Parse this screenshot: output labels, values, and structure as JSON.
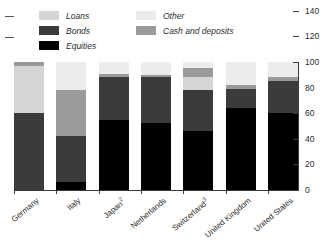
{
  "legend": {
    "columns": [
      {
        "items": [
          {
            "label": "Loans",
            "color": "#d5d5d5",
            "name": "legend-loans"
          },
          {
            "label": "Bonds",
            "color": "#3b3b3b",
            "name": "legend-bonds"
          },
          {
            "label": "Equities",
            "color": "#000000",
            "name": "legend-equities"
          }
        ]
      },
      {
        "items": [
          {
            "label": "Other",
            "color": "#ececec",
            "name": "legend-other"
          },
          {
            "label": "Cash and deposits",
            "color": "#9a9a9a",
            "name": "legend-cash-and-deposits"
          }
        ]
      }
    ]
  },
  "axis": {
    "ticks": [
      {
        "value": 0,
        "label": "0"
      },
      {
        "value": 20,
        "label": "20"
      },
      {
        "value": 40,
        "label": "40"
      },
      {
        "value": 60,
        "label": "60"
      },
      {
        "value": 80,
        "label": "80"
      },
      {
        "value": 100,
        "label": "100"
      },
      {
        "value": 120,
        "label": "120"
      },
      {
        "value": 140,
        "label": "140"
      }
    ]
  },
  "chart_data": {
    "type": "bar",
    "subtype": "stacked-100",
    "title": "",
    "xlabel": "",
    "ylabel": "",
    "ylim": [
      0,
      140
    ],
    "grid": false,
    "legend_position": "top",
    "categories": [
      "Germany",
      "Italy",
      "Japan2",
      "Netherlands",
      "Switzerland3",
      "United Kingdom",
      "United States"
    ],
    "category_labels": [
      {
        "text": "Germany",
        "footnote": ""
      },
      {
        "text": "Italy",
        "footnote": ""
      },
      {
        "text": "Japan",
        "footnote": "2"
      },
      {
        "text": "Netherlands",
        "footnote": ""
      },
      {
        "text": "Switzerland",
        "footnote": "3"
      },
      {
        "text": "United Kingdom",
        "footnote": ""
      },
      {
        "text": "United States",
        "footnote": ""
      }
    ],
    "series": [
      {
        "name": "Equities",
        "color": "#000000",
        "values": [
          0,
          6,
          55,
          52,
          46,
          64,
          60
        ]
      },
      {
        "name": "Bonds",
        "color": "#3b3b3b",
        "values": [
          60,
          36,
          33,
          36,
          32,
          15,
          25
        ]
      },
      {
        "name": "Cash and deposits",
        "color": "#9a9a9a",
        "values": [
          0,
          36,
          3,
          0,
          7,
          3,
          3
        ]
      },
      {
        "name": "Loans",
        "color": "#d5d5d5",
        "values": [
          37,
          0,
          0,
          0,
          10,
          0,
          0
        ]
      },
      {
        "name": "Other",
        "color": "#ececec",
        "values": [
          3,
          22,
          9,
          12,
          5,
          18,
          12
        ]
      }
    ],
    "stack_order": [
      "Equities",
      "Bonds",
      "Cash and deposits",
      "Loans",
      "Other"
    ],
    "bars": [
      {
        "category": "Germany",
        "segments": [
          {
            "series": "Bonds",
            "value": 60,
            "color": "#3b3b3b"
          },
          {
            "series": "Loans",
            "value": 37,
            "color": "#d5d5d5"
          },
          {
            "series": "Cash and deposits",
            "value": 3,
            "color": "#9a9a9a"
          }
        ]
      },
      {
        "category": "Italy",
        "segments": [
          {
            "series": "Equities",
            "value": 6,
            "color": "#000000"
          },
          {
            "series": "Bonds",
            "value": 36,
            "color": "#3b3b3b"
          },
          {
            "series": "Cash and deposits",
            "value": 36,
            "color": "#9a9a9a"
          },
          {
            "series": "Other",
            "value": 22,
            "color": "#ececec"
          }
        ]
      },
      {
        "category": "Japan",
        "segments": [
          {
            "series": "Equities",
            "value": 55,
            "color": "#000000"
          },
          {
            "series": "Bonds",
            "value": 33,
            "color": "#3b3b3b"
          },
          {
            "series": "Cash and deposits",
            "value": 3,
            "color": "#9a9a9a"
          },
          {
            "series": "Other",
            "value": 9,
            "color": "#ececec"
          }
        ]
      },
      {
        "category": "Netherlands",
        "segments": [
          {
            "series": "Equities",
            "value": 52,
            "color": "#000000"
          },
          {
            "series": "Bonds",
            "value": 36,
            "color": "#3b3b3b"
          },
          {
            "series": "Cash and deposits",
            "value": 2,
            "color": "#9a9a9a"
          },
          {
            "series": "Other",
            "value": 10,
            "color": "#ececec"
          }
        ]
      },
      {
        "category": "Switzerland",
        "segments": [
          {
            "series": "Equities",
            "value": 46,
            "color": "#000000"
          },
          {
            "series": "Bonds",
            "value": 32,
            "color": "#3b3b3b"
          },
          {
            "series": "Loans",
            "value": 10,
            "color": "#d5d5d5"
          },
          {
            "series": "Cash and deposits",
            "value": 7,
            "color": "#9a9a9a"
          },
          {
            "series": "Other",
            "value": 5,
            "color": "#ececec"
          }
        ]
      },
      {
        "category": "United Kingdom",
        "segments": [
          {
            "series": "Equities",
            "value": 64,
            "color": "#000000"
          },
          {
            "series": "Bonds",
            "value": 15,
            "color": "#3b3b3b"
          },
          {
            "series": "Cash and deposits",
            "value": 3,
            "color": "#9a9a9a"
          },
          {
            "series": "Other",
            "value": 18,
            "color": "#ececec"
          }
        ]
      },
      {
        "category": "United States",
        "segments": [
          {
            "series": "Equities",
            "value": 60,
            "color": "#000000"
          },
          {
            "series": "Bonds",
            "value": 25,
            "color": "#3b3b3b"
          },
          {
            "series": "Cash and deposits",
            "value": 3,
            "color": "#9a9a9a"
          },
          {
            "series": "Other",
            "value": 12,
            "color": "#ececec"
          }
        ]
      }
    ]
  }
}
